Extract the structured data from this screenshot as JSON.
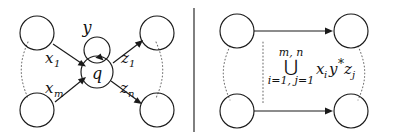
{
  "figure": {
    "background_color": "#ffffff",
    "ink_color": "#1a1a1a",
    "dotted_color": "#6e6e6e",
    "divider_color": "#2a2a2a"
  },
  "left_diagram": {
    "name": "star-automaton-with-central-state",
    "center_state": {
      "label": "q"
    },
    "self_loop": {
      "label": "y"
    },
    "input_edges": [
      {
        "label": "x₁",
        "plain": "x_1",
        "base": "x",
        "sub": "1"
      },
      {
        "label": "xₘ",
        "plain": "x_m",
        "base": "x",
        "sub": "m"
      }
    ],
    "output_edges": [
      {
        "label": "z₁",
        "plain": "z_1",
        "base": "z",
        "sub": "1"
      },
      {
        "label": "zₙ",
        "plain": "z_n",
        "base": "z",
        "sub": "n"
      }
    ],
    "outer_states": [
      {
        "position": "top-left",
        "label": ""
      },
      {
        "position": "bottom-left",
        "label": ""
      },
      {
        "position": "top-right",
        "label": ""
      },
      {
        "position": "bottom-right",
        "label": ""
      }
    ],
    "ellipsis_marks": [
      {
        "side": "left",
        "style": "dotted-arc"
      },
      {
        "side": "right",
        "style": "dotted-arc"
      }
    ]
  },
  "right_diagram": {
    "name": "collapsed-automaton-with-union-expression",
    "states": [
      {
        "position": "top-left",
        "label": ""
      },
      {
        "position": "top-right",
        "label": ""
      },
      {
        "position": "bottom-left",
        "label": ""
      },
      {
        "position": "bottom-right",
        "label": ""
      }
    ],
    "edges": [
      {
        "from": "top-left",
        "to": "top-right",
        "label": ""
      },
      {
        "from": "bottom-left",
        "to": "bottom-right",
        "label": ""
      }
    ],
    "expression": {
      "operator": "⋃",
      "operator_name": "big-union",
      "upper_limit": "m, n",
      "lower_limit": "i=1, j=1",
      "body_plain": "x_i y^* z_j",
      "body_parts": [
        {
          "base": "x",
          "sub": "i"
        },
        {
          "base": "y",
          "sup": "*"
        },
        {
          "base": "z",
          "sub": "j"
        }
      ]
    },
    "ellipsis_marks": [
      {
        "side": "left",
        "style": "dotted-arc"
      },
      {
        "side": "middle",
        "style": "dotted-vertical"
      },
      {
        "side": "right",
        "style": "dotted-arc"
      }
    ]
  },
  "divider": {
    "orientation": "vertical",
    "label": ""
  }
}
